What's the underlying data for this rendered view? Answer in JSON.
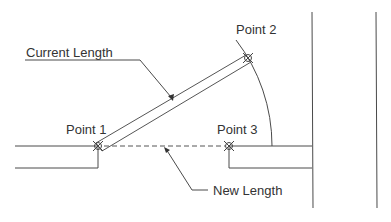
{
  "diagram": {
    "type": "cad-lengthen-illustration",
    "labels": {
      "current_length": "Current Length",
      "new_length": "New Length",
      "point1": "Point 1",
      "point2": "Point 2",
      "point3": "Point 3"
    },
    "colors": {
      "line": "#4a4a4a",
      "text": "#333333",
      "background": "#ffffff"
    }
  }
}
